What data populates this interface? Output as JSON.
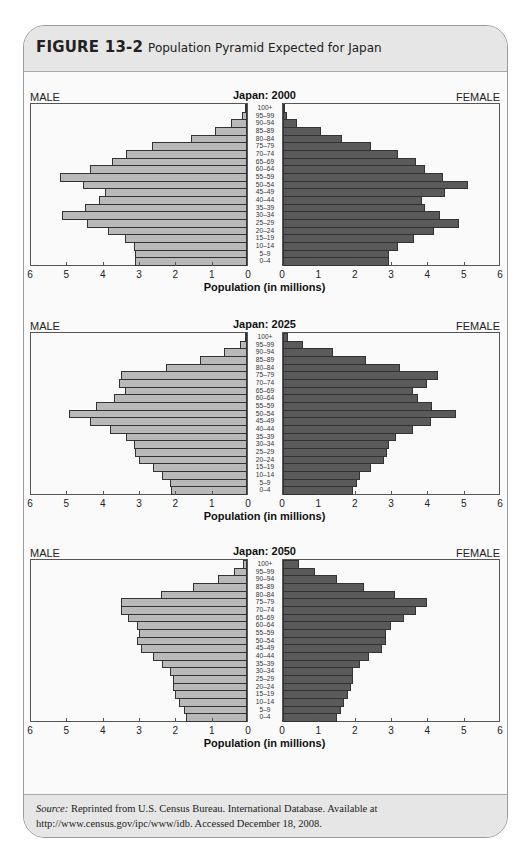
{
  "figure": {
    "number": "FIGURE 13-2",
    "caption": "Population Pyramid Expected for Japan"
  },
  "source": {
    "label": "Source:",
    "text": " Reprinted from U.S. Census Bureau. International Database. Available at http://www.census.gov/ipc/www/idb. Accessed December 18, 2008."
  },
  "labels": {
    "male": "MALE",
    "female": "FEMALE",
    "xaxis": "Population (in millions)"
  },
  "colors": {
    "male": "#b9b9b9",
    "female": "#5a5a5a"
  },
  "chart_data": [
    {
      "type": "bar",
      "subtype": "population-pyramid",
      "title": "Japan: 2000",
      "xlabel": "Population (in millions)",
      "ylabel": "",
      "xlim": [
        0,
        6
      ],
      "xticks": [
        6,
        5,
        4,
        3,
        2,
        1,
        0,
        0,
        1,
        2,
        3,
        4,
        5,
        6
      ],
      "legend": [
        "MALE",
        "FEMALE"
      ],
      "grid": false,
      "categories": [
        "100+",
        "95–99",
        "90–94",
        "85–89",
        "80–84",
        "75–79",
        "70–74",
        "65–69",
        "60–64",
        "55–59",
        "50–54",
        "45–49",
        "40–44",
        "35–39",
        "30–34",
        "25–29",
        "20–24",
        "15–19",
        "10–14",
        "5–9",
        "0–4"
      ],
      "series": [
        {
          "name": "MALE",
          "values": [
            0.05,
            0.15,
            0.45,
            0.9,
            1.55,
            2.65,
            3.35,
            3.75,
            4.35,
            5.2,
            4.55,
            3.95,
            4.1,
            4.5,
            5.15,
            4.45,
            3.85,
            3.4,
            3.15,
            3.1,
            3.1
          ]
        },
        {
          "name": "FEMALE",
          "values": [
            0.05,
            0.1,
            0.4,
            1.05,
            1.65,
            2.45,
            3.2,
            3.7,
            3.95,
            4.45,
            5.15,
            4.5,
            3.85,
            3.95,
            4.35,
            4.9,
            4.2,
            3.65,
            3.2,
            2.95,
            2.95
          ]
        }
      ]
    },
    {
      "type": "bar",
      "subtype": "population-pyramid",
      "title": "Japan: 2025",
      "xlabel": "Population (in millions)",
      "ylabel": "",
      "xlim": [
        0,
        6
      ],
      "xticks": [
        6,
        5,
        4,
        3,
        2,
        1,
        0,
        0,
        1,
        2,
        3,
        4,
        5,
        6
      ],
      "legend": [
        "MALE",
        "FEMALE"
      ],
      "grid": false,
      "categories": [
        "100+",
        "95–99",
        "90–94",
        "85–89",
        "80–84",
        "75–79",
        "70–74",
        "65–69",
        "60–64",
        "55–59",
        "50–54",
        "45–49",
        "40–44",
        "35–39",
        "30–34",
        "25–29",
        "20–24",
        "15–19",
        "10–14",
        "5–9",
        "0–4"
      ],
      "series": [
        {
          "name": "MALE",
          "values": [
            0.05,
            0.2,
            0.65,
            1.3,
            2.25,
            3.5,
            3.55,
            3.4,
            3.7,
            4.2,
            4.95,
            4.35,
            3.8,
            3.35,
            3.15,
            3.1,
            3.0,
            2.6,
            2.35,
            2.15,
            2.1
          ]
        },
        {
          "name": "FEMALE",
          "values": [
            0.15,
            0.55,
            1.4,
            2.3,
            3.25,
            4.3,
            4.0,
            3.6,
            3.75,
            4.15,
            4.8,
            4.1,
            3.6,
            3.15,
            2.95,
            2.9,
            2.8,
            2.45,
            2.15,
            2.05,
            1.95
          ]
        }
      ]
    },
    {
      "type": "bar",
      "subtype": "population-pyramid",
      "title": "Japan: 2050",
      "xlabel": "Population (in millions)",
      "ylabel": "",
      "xlim": [
        0,
        6
      ],
      "xticks": [
        6,
        5,
        4,
        3,
        2,
        1,
        0,
        0,
        1,
        2,
        3,
        4,
        5,
        6
      ],
      "legend": [
        "MALE",
        "FEMALE"
      ],
      "grid": false,
      "categories": [
        "100+",
        "95–99",
        "90–94",
        "85–89",
        "80–84",
        "75–79",
        "70–74",
        "65–69",
        "60–64",
        "55–59",
        "50–54",
        "45–49",
        "40–44",
        "35–39",
        "30–34",
        "25–29",
        "20–24",
        "15–19",
        "10–14",
        "5–9",
        "0–4"
      ],
      "series": [
        {
          "name": "MALE",
          "values": [
            0.1,
            0.35,
            0.8,
            1.5,
            2.4,
            3.5,
            3.5,
            3.3,
            3.05,
            3.0,
            3.05,
            2.95,
            2.6,
            2.35,
            2.15,
            2.05,
            2.05,
            2.0,
            1.9,
            1.75,
            1.7
          ]
        },
        {
          "name": "FEMALE",
          "values": [
            0.45,
            0.9,
            1.5,
            2.25,
            3.1,
            4.0,
            3.7,
            3.35,
            3.0,
            2.85,
            2.85,
            2.75,
            2.4,
            2.15,
            1.95,
            1.95,
            1.9,
            1.8,
            1.7,
            1.6,
            1.5
          ]
        }
      ]
    }
  ]
}
